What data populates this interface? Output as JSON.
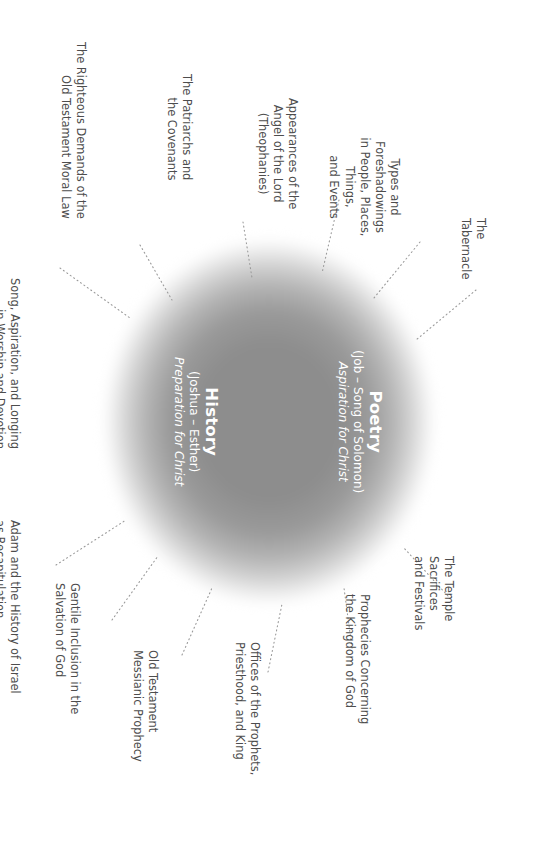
{
  "diagram": {
    "type": "radial-label-diagram",
    "orientation_degrees": 90,
    "colors": {
      "blob_core": "#8d8d8d",
      "blob_edge": "#ffffff",
      "center_text": "#ffffff",
      "label_text": "#4d4d4d",
      "leader_line": "#9a9a9a",
      "background": "#ffffff"
    }
  },
  "center": {
    "sections": [
      {
        "title": "The Law",
        "range": "(Genesis – Deuteronomy)",
        "role": "Foundation for Christ"
      },
      {
        "title": "History",
        "range": "(Joshua – Esther)",
        "role": "Preparation for Christ"
      },
      {
        "title": "Poetry",
        "range": "(Job – Song of Solomon)",
        "role": "Aspiration for Christ"
      },
      {
        "title": "Prophecy",
        "range": "(Isaiah – Malachi)",
        "role": "Expectation of Christ"
      }
    ]
  },
  "labels": [
    {
      "id": "song-aspiration",
      "text": "Song, Aspiration, and Longing\nin Worship and Devotion"
    },
    {
      "id": "righteous-demands",
      "text": "The Righteous Demands of the\nOld Testament Moral Law"
    },
    {
      "id": "patriarchs-covenants",
      "text": "The Patriarchs and\nthe Covenants"
    },
    {
      "id": "angel-of-the-lord",
      "text": "Appearances of the\nAngel of the Lord\n(Theophanies)"
    },
    {
      "id": "types-foreshadowings",
      "text": "Types and Foreshadowings\nin People, Places, Things,\nand Events"
    },
    {
      "id": "tabernacle",
      "text": "The Tabernacle"
    },
    {
      "id": "adam-recapitulation",
      "text": "Adam and the History of Israel\nas Recapitulation"
    },
    {
      "id": "gentile-inclusion",
      "text": "Gentile Inclusion in the\nSalvation of God"
    },
    {
      "id": "messianic-prophecy",
      "text": "Old Testament\nMessianic Prophecy"
    },
    {
      "id": "offices",
      "text": "Offices of the Prophets,\nPriesthood, and King"
    },
    {
      "id": "kingdom-prophecies",
      "text": "Prophecies Concerning\nthe Kingdom of God"
    },
    {
      "id": "temple-sacrifices",
      "text": "The Temple Sacrifices\nand Festivals"
    }
  ]
}
